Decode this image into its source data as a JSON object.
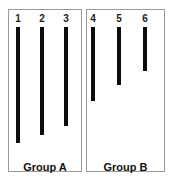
{
  "figure": {
    "background_color": "#ffffff",
    "bar_color": "#0d0d0d",
    "panel_border_color": "#9a9a9a",
    "label_color": "#1b1b1b"
  },
  "chart_data": {
    "type": "bar",
    "orientation": "vertical-descending",
    "title": "",
    "subtitle": "",
    "xlabel": "",
    "ylabel": "",
    "grid": false,
    "legend_position": "none",
    "categories": [
      "1",
      "2",
      "3",
      "4",
      "5",
      "6"
    ],
    "values": [
      116,
      108,
      99,
      74,
      58,
      44
    ],
    "value_unit": "px-length",
    "ylim": [
      0,
      120
    ],
    "series": [
      {
        "name": "bar-length",
        "values": [
          116,
          108,
          99,
          74,
          58,
          44
        ]
      }
    ],
    "groups": [
      {
        "name": "Group A",
        "caption": "Group A",
        "categories": [
          "1",
          "2",
          "3"
        ],
        "values": [
          116,
          108,
          99
        ]
      },
      {
        "name": "Group B",
        "caption": "Group B",
        "categories": [
          "4",
          "5",
          "6"
        ],
        "values": [
          74,
          58,
          44
        ]
      }
    ],
    "annotations": [
      "Group A",
      "Group B"
    ]
  },
  "panels": [
    {
      "id": "a",
      "caption": "Group A",
      "bars": [
        {
          "label": "1",
          "cx": 18,
          "top": 27,
          "length": 116
        },
        {
          "label": "2",
          "cx": 42,
          "top": 27,
          "length": 108
        },
        {
          "label": "3",
          "cx": 66,
          "top": 27,
          "length": 99
        }
      ]
    },
    {
      "id": "b",
      "caption": "Group B",
      "bars": [
        {
          "label": "4",
          "cx": 93,
          "top": 27,
          "length": 74
        },
        {
          "label": "5",
          "cx": 119,
          "top": 27,
          "length": 58
        },
        {
          "label": "6",
          "cx": 145,
          "top": 27,
          "length": 44
        }
      ]
    }
  ]
}
